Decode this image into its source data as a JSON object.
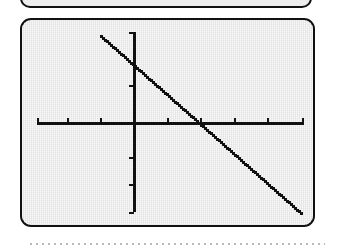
{
  "screen": {
    "label": "graphing-calculator-display",
    "background_color": "#ebebeb",
    "border_color": "#111111"
  },
  "top_partial_screen": {
    "label": "previous graphing calculator display (cropped)"
  },
  "separator": {
    "label": "dotted rule",
    "color": "#b9b9b9"
  },
  "chart_data": {
    "type": "line",
    "title": "",
    "subtitle": "",
    "xlabel": "",
    "ylabel": "",
    "grid": false,
    "legend": null,
    "axis_color": "#111111",
    "curve_color": "#111111",
    "curve_style": "pixelated-dotted",
    "xlim": [
      -10,
      10
    ],
    "ylim": [
      -10,
      10
    ],
    "xticks": [
      -8,
      -6,
      -4,
      -2,
      2,
      4,
      6,
      8
    ],
    "yticks": [
      -8,
      -4,
      4,
      8
    ],
    "xtick_labels": [],
    "ytick_labels": [],
    "series": [
      {
        "name": "y = -2x + 4",
        "slope": -2,
        "y_intercept": 4,
        "x_intercept": 2,
        "x": [
          -7.3,
          -6,
          -4,
          -2,
          0,
          2,
          4,
          6,
          8,
          9.9
        ],
        "values": [
          18.6,
          16,
          12,
          8,
          4,
          0,
          -4,
          -8,
          -12,
          -15.8
        ]
      }
    ],
    "annotations": []
  },
  "geometry": {
    "note": "pixel layout of the rendered trace, read from the display",
    "screen_px": {
      "x": 20,
      "y": 18,
      "w": 295,
      "h": 209
    },
    "origin_px": {
      "x": 112,
      "y": 103
    },
    "x_axis_px": {
      "y": 103,
      "x_start": 15,
      "x_end": 282
    },
    "y_axis_px": {
      "x": 112,
      "y_start": 12,
      "y_end": 192
    },
    "x_tick_px": [
      15,
      45,
      78,
      145,
      178,
      212,
      245,
      280
    ],
    "y_tick_px": [
      12,
      65,
      137,
      164,
      192
    ],
    "line_px": {
      "x1": 78,
      "y1": 15,
      "x2": 279,
      "y2": 193
    }
  }
}
